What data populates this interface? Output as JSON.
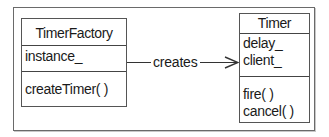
{
  "diagram": {
    "type": "UML class diagram",
    "classes": [
      {
        "name": "TimerFactory",
        "attributes": [
          "instance_"
        ],
        "operations": [
          "createTimer( )"
        ]
      },
      {
        "name": "Timer",
        "attributes": [
          "delay_",
          "client_"
        ],
        "operations": [
          "fire( )",
          "cancel( )"
        ]
      }
    ],
    "associations": [
      {
        "from": "TimerFactory",
        "to": "Timer",
        "label": "creates",
        "arrow": "open"
      }
    ]
  },
  "colors": {
    "line": "#444444",
    "frame": "#6a6a6a",
    "background": "#ffffff",
    "text": "#1a1a1a"
  }
}
